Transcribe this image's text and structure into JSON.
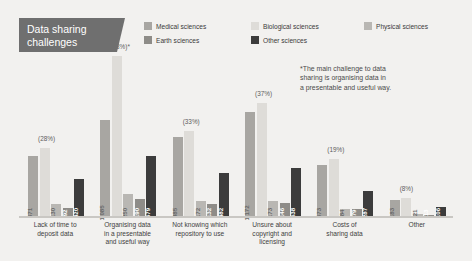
{
  "title": {
    "line1": "Data sharing",
    "line2": "challenges",
    "bg_color": "#6f6f6f"
  },
  "annotation": {
    "line1": "*The main challenge to data",
    "line2": "sharing is organising data in",
    "line3": "a presentable and useful way."
  },
  "chart_data": {
    "type": "bar",
    "title": "Data sharing challenges",
    "xlabel": "",
    "ylabel": "",
    "grid": false,
    "legend_position": "top-right",
    "ylim": [
      0,
      1800
    ],
    "categories": [
      "Lack of time to deposit data",
      "Organising data in a presentable and useful way",
      "Not knowing which repository to use",
      "Unsure about copyright and licensing",
      "Costs of sharing data",
      "Other"
    ],
    "category_lines": [
      [
        "Lack of time to",
        "deposit data"
      ],
      [
        "Organising data",
        "in a presentable",
        "and useful way"
      ],
      [
        "Not knowing which",
        "repository to use"
      ],
      [
        "Unsure about",
        "copyright and",
        "licensing"
      ],
      [
        "Costs of",
        "sharing data"
      ],
      [
        "Other"
      ]
    ],
    "group_percent_labels": [
      "(28%)",
      "(48%)*",
      "(33%)",
      "(37%)",
      "(19%)",
      "(8%)"
    ],
    "series": [
      {
        "name": "Medical sciences",
        "color": "#a8a6a2",
        "values": [
          671,
          1085,
          885,
          1172,
          573,
          183
        ],
        "labels": [
          "671",
          "1,085",
          "885",
          "1,172",
          "573",
          "183"
        ]
      },
      {
        "name": "Biological sciences",
        "color": "#dedcd8",
        "values": [
          760,
          1800,
          960,
          1270,
          640,
          200
        ],
        "labels": [
          "",
          "",
          "",
          "",
          "",
          ""
        ]
      },
      {
        "name": "Physical sciences",
        "color": "#b9b7b3",
        "values": [
          130,
          250,
          172,
          173,
          84,
          21
        ],
        "labels": [
          "130",
          "250",
          "172",
          "173",
          "84",
          "21"
        ]
      },
      {
        "name": "Earth sciences",
        "color": "#8e8c88",
        "values": [
          92,
          190,
          132,
          146,
          79,
          13
        ],
        "labels": [
          "92",
          "190",
          "132",
          "146",
          "79",
          "13"
        ]
      },
      {
        "name": "Other sciences",
        "color": "#3c3c3c",
        "values": [
          420,
          679,
          482,
          538,
          287,
          106
        ],
        "labels": [
          "420",
          "679",
          "482",
          "538",
          "287",
          "106"
        ]
      }
    ]
  }
}
